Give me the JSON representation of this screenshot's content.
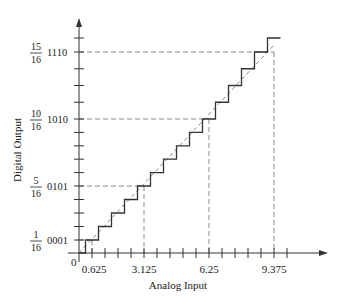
{
  "chart_data": {
    "type": "line",
    "title": "",
    "xlabel": "Analog Input",
    "ylabel": "Digital Output",
    "origin_label": "0",
    "x_lsb": 0.625,
    "x_tick_count": 16,
    "x_tick_labels": [
      {
        "value": 0.625,
        "label": "0.625"
      },
      {
        "value": 3.125,
        "label": "3.125"
      },
      {
        "value": 6.25,
        "label": "6.25"
      },
      {
        "value": 9.375,
        "label": "9.375"
      }
    ],
    "y_tick_count": 15,
    "y_tick_labels": [
      {
        "level": 1,
        "code": "0001",
        "num": "1",
        "den": "16"
      },
      {
        "level": 5,
        "code": "0101",
        "num": "5",
        "den": "16"
      },
      {
        "level": 10,
        "code": "1010",
        "num": "10",
        "den": "16"
      },
      {
        "level": 14,
        "code": "1110",
        "num": "15",
        "den": "16"
      }
    ],
    "staircase": {
      "name": "Quantized output",
      "transitions_x": [
        0.3125,
        0.9375,
        1.5625,
        2.1875,
        2.8125,
        3.4375,
        4.0625,
        4.6875,
        5.3125,
        5.9375,
        6.5625,
        7.1875,
        7.8125,
        8.4375,
        9.0625
      ],
      "levels": [
        0,
        1,
        2,
        3,
        4,
        5,
        6,
        7,
        8,
        9,
        10,
        11,
        12,
        13,
        14,
        15
      ],
      "end_x": 9.6875
    },
    "ideal_line": {
      "name": "Ideal transfer (dashed)",
      "from": [
        0,
        0
      ],
      "to": [
        9.375,
        14.5
      ]
    },
    "reference_guides": [
      {
        "x": 0.625,
        "level": 1
      },
      {
        "x": 3.125,
        "level": 5
      },
      {
        "x": 6.25,
        "level": 10
      },
      {
        "x": 9.375,
        "level": 14
      }
    ],
    "xlim": [
      0,
      10.3
    ],
    "ylim": [
      0,
      16
    ],
    "grid": false,
    "legend": "none"
  },
  "colors": {
    "axis": "#333333",
    "staircase": "#333333",
    "dashed": "#888888",
    "background": "#ffffff"
  }
}
